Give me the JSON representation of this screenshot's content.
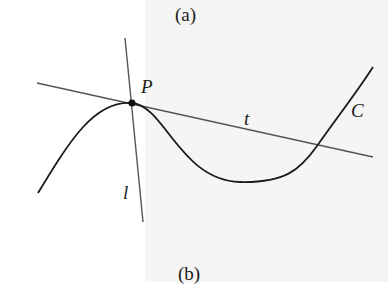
{
  "captions": {
    "top": "(a)",
    "bottom": "(b)"
  },
  "labels": {
    "point": "P",
    "tangent": "t",
    "curve": "C",
    "normal": "l"
  },
  "colors": {
    "curve": "#1a1a1a",
    "lines": "#555555",
    "background_right": "#f5f5f5"
  },
  "geometry": {
    "point_P": [
      132,
      103
    ],
    "curve_C": "M38,193 C70,140 95,100 132,103 C165,106 180,180 240,182 C285,183 300,170 317,146 C335,120 355,95 373,67",
    "tangent_t": [
      [
        37,
        83
      ],
      [
        373,
        157
      ]
    ],
    "normal_l": [
      [
        125,
        38
      ],
      [
        143,
        222
      ]
    ]
  }
}
